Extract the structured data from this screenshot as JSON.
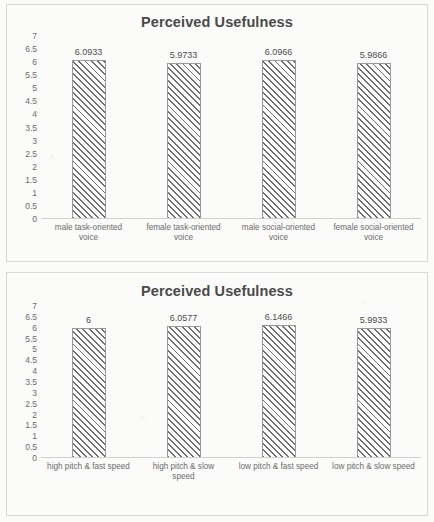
{
  "chart_data": [
    {
      "type": "bar",
      "title": "Perceived Usefulness",
      "xlabel": "",
      "ylabel": "",
      "ylim": [
        0,
        7
      ],
      "ytick_step": 0.5,
      "yticks": [
        "7",
        "6.5",
        "6",
        "5.5",
        "5",
        "4.5",
        "4",
        "3.5",
        "3",
        "2.5",
        "2",
        "1.5",
        "1",
        "0.5",
        "0"
      ],
      "grid": false,
      "legend": "none",
      "categories": [
        "male task-oriented voice",
        "female task-oriented voice",
        "male social-oriented voice",
        "female social-oriented voice"
      ],
      "category_lines": [
        [
          "male task-oriented",
          "voice"
        ],
        [
          "female task-oriented",
          "voice"
        ],
        [
          "male social-oriented",
          "voice"
        ],
        [
          "female social-oriented",
          "voice"
        ]
      ],
      "values": [
        6.0933,
        5.9733,
        6.0966,
        5.9866
      ],
      "value_labels": [
        "6.0933",
        "5.9733",
        "6.0966",
        "5.9866"
      ]
    },
    {
      "type": "bar",
      "title": "Perceived Usefulness",
      "xlabel": "",
      "ylabel": "",
      "ylim": [
        0,
        7
      ],
      "ytick_step": 0.5,
      "yticks": [
        "7",
        "6.5",
        "6",
        "5.5",
        "5",
        "4.5",
        "4",
        "3.5",
        "3",
        "2.5",
        "2",
        "1.5",
        "1",
        "0.5",
        "0"
      ],
      "grid": false,
      "legend": "none",
      "categories": [
        "high pitch & fast speed",
        "high pitch & slow speed",
        "low pitch & fast speed",
        "low pitch & slow speed"
      ],
      "category_lines": [
        [
          "high pitch & fast speed"
        ],
        [
          "high pitch & slow",
          "speed"
        ],
        [
          "low pitch & fast speed"
        ],
        [
          "low pitch & slow speed"
        ]
      ],
      "values": [
        6,
        6.0577,
        6.1466,
        5.9933
      ],
      "value_labels": [
        "6",
        "6.0577",
        "6.1466",
        "5.9933"
      ]
    }
  ],
  "colors": {
    "bar_hatch": "#6e6e6e",
    "bar_fill": "#ffffff",
    "bar_border": "#9a9a9a",
    "axis_line": "#d0d0d0",
    "text": "#6b6b6b",
    "title": "#4a4a4a",
    "panel_border": "#d8d8d8",
    "background": "#fbfbf9"
  }
}
